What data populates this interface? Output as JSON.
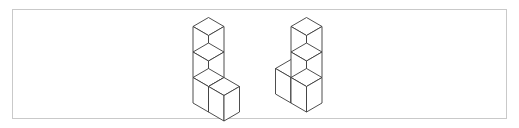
{
  "image": {
    "width": 519,
    "height": 128,
    "background_color": "#ffffff",
    "description": "Two isometric cube assemblies drawn as white line art inside a thin rectangular border"
  },
  "panel": {
    "border_color": "#c9c9c9",
    "fill_color": "#ffffff",
    "x": 12,
    "y": 9,
    "width": 495,
    "height": 110
  },
  "drawing": {
    "line_color": "#3a3a3a",
    "face_fill": "#ffffff",
    "line_width": 0.9,
    "projection": "isometric",
    "cube_half_width": 15.5,
    "cube_diamond_half_height": 9,
    "cube_edge_height": 25.5
  },
  "figures": [
    {
      "id": "left-figure",
      "name": "left-cube-assembly",
      "cube_count": 4,
      "shape": "L-shape",
      "origin_x": 208.5,
      "origin_y": 112,
      "description": "Vertical stack of three cubes with a fourth cube attached to the right of the bottom cube",
      "cells": [
        {
          "col": 0,
          "row": 0,
          "depth": 0
        },
        {
          "col": 0,
          "row": 1,
          "depth": 0
        },
        {
          "col": 0,
          "row": 2,
          "depth": 0
        },
        {
          "col": 1,
          "row": 0,
          "depth": 0
        }
      ]
    },
    {
      "id": "right-figure",
      "name": "right-cube-assembly",
      "cube_count": 4,
      "shape": "mirrored-L-shape",
      "origin_x": 306.5,
      "origin_y": 112,
      "description": "Vertical stack of three cubes with a fourth cube attached to the left of the bottom cube",
      "cells": [
        {
          "col": 0,
          "row": 0,
          "depth": 0
        },
        {
          "col": 0,
          "row": 1,
          "depth": 0
        },
        {
          "col": 0,
          "row": 2,
          "depth": 0
        },
        {
          "col": -1,
          "row": 0,
          "depth": 0
        }
      ]
    }
  ]
}
